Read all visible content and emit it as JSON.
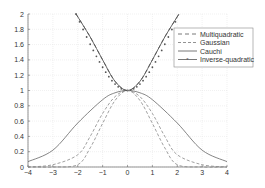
{
  "chart_data": {
    "type": "line",
    "title": "",
    "xlabel": "",
    "ylabel": "",
    "xlim": [
      -4,
      4
    ],
    "ylim": [
      0,
      2
    ],
    "grid": true,
    "legend_position": "upper right (inside)",
    "x_ticks": [
      -4,
      -3,
      -2,
      -1,
      0,
      1,
      2,
      3,
      4
    ],
    "y_ticks": [
      0,
      0.2,
      0.4,
      0.6,
      0.8,
      1,
      1.2,
      1.4,
      1.6,
      1.8,
      2
    ],
    "x_tick_labels": [
      "-4",
      "-3",
      "-2",
      "-1",
      "0",
      "1",
      "2",
      "3",
      "4"
    ],
    "y_tick_labels": [
      "0",
      "0.2",
      "0.4",
      "0.6",
      "0.8",
      "1",
      "1.2",
      "1.4",
      "1.6",
      "1.8",
      "2"
    ],
    "series": [
      {
        "name": "Multiquadratic",
        "style": "dash-dot (long dash)",
        "x": [
          -2.07,
          -1.5,
          -1,
          -0.5,
          0,
          0.5,
          1,
          1.5,
          2.07
        ],
        "values": [
          2.0,
          1.7,
          1.4,
          1.12,
          1.0,
          1.12,
          1.4,
          1.7,
          2.0
        ]
      },
      {
        "name": "Gaussian",
        "style": "dashed",
        "x": [
          -4,
          -3,
          -2,
          -1.5,
          -1,
          -0.5,
          0,
          0.5,
          1,
          1.5,
          2,
          3,
          4
        ],
        "values": [
          0.0,
          0.0,
          0.03,
          0.25,
          0.57,
          0.87,
          1.0,
          0.87,
          0.57,
          0.25,
          0.03,
          0.0,
          0.0
        ]
      },
      {
        "name": "Cauchi",
        "style": "solid",
        "x": [
          -4,
          -3,
          -2,
          -1,
          -0.5,
          0,
          0.5,
          1,
          2,
          3,
          4
        ],
        "values": [
          0.07,
          0.22,
          0.575,
          0.88,
          0.97,
          1.0,
          0.97,
          0.88,
          0.575,
          0.22,
          0.07
        ]
      },
      {
        "name": "Inverse-quadratic",
        "style": "solid with star markers",
        "x": [
          -2.07,
          -1.5,
          -1,
          -0.5,
          0,
          0.5,
          1,
          1.5,
          2.07
        ],
        "values": [
          2.0,
          1.7,
          1.4,
          1.12,
          1.0,
          1.12,
          1.4,
          1.7,
          2.0
        ]
      },
      {
        "name": "unlabeled-dashed-middle",
        "style": "dashed",
        "x": [
          -4,
          -3,
          -2,
          -1.5,
          -1,
          -0.5,
          0,
          0.5,
          1,
          1.5,
          2,
          3,
          4
        ],
        "values": [
          0.0,
          0.03,
          0.16,
          0.4,
          0.7,
          0.92,
          1.0,
          0.92,
          0.7,
          0.4,
          0.16,
          0.03,
          0.0
        ]
      }
    ]
  },
  "legend": {
    "items": [
      {
        "label": "Multiquadratic"
      },
      {
        "label": "Gaussian"
      },
      {
        "label": "Cauchi"
      },
      {
        "label": "Inverse-quadratic"
      }
    ]
  }
}
